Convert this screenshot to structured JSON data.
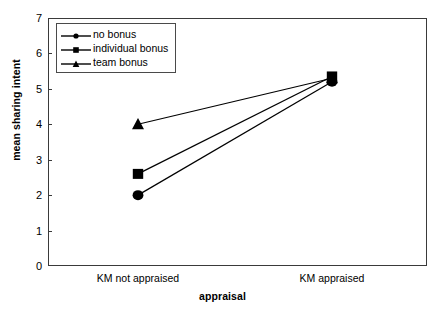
{
  "chart_data": {
    "type": "line",
    "title": "",
    "xlabel": "appraisal",
    "ylabel": "mean sharing intent",
    "categories": [
      "KM not appraised",
      "KM appraised"
    ],
    "ylim": [
      0,
      7
    ],
    "yticks": [
      0,
      1,
      2,
      3,
      4,
      5,
      6,
      7
    ],
    "ytick_labels": [
      "0",
      "1",
      "2",
      "3",
      "4",
      "5",
      "6",
      "7"
    ],
    "grid": false,
    "legend_position": "upper left inside",
    "series": [
      {
        "name": "no bonus",
        "marker": "circle",
        "values": [
          2.0,
          5.2
        ]
      },
      {
        "name": "individual bonus",
        "marker": "square",
        "values": [
          2.6,
          5.35
        ]
      },
      {
        "name": "team bonus",
        "marker": "triangle",
        "values": [
          4.0,
          5.3
        ]
      }
    ]
  },
  "legend": {
    "items": [
      {
        "label": "no bonus",
        "marker": "circle-marker-icon"
      },
      {
        "label": "individual bonus",
        "marker": "square-marker-icon"
      },
      {
        "label": "team bonus",
        "marker": "triangle-marker-icon"
      }
    ]
  },
  "axes": {
    "y_label": "mean sharing intent",
    "x_label": "appraisal",
    "y_ticks": [
      "7",
      "6",
      "5",
      "4",
      "3",
      "2",
      "1",
      "0"
    ],
    "x_ticks": [
      "KM not appraised",
      "KM appraised"
    ]
  },
  "colors": {
    "line": "#000000",
    "marker": "#000000",
    "frame": "#3a3a3a",
    "background": "#ffffff"
  }
}
